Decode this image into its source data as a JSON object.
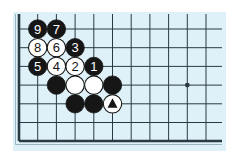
{
  "diagram": {
    "board_color": "#dff1f8",
    "line_color": "#2a3a44",
    "grid": {
      "columns": 11,
      "rows": 7,
      "left_edge": true,
      "bottom_edge": true
    },
    "star_points": [
      {
        "col": 9,
        "row": 3
      }
    ],
    "stones": [
      {
        "color": "black",
        "col": 1,
        "row": 0,
        "label": "9"
      },
      {
        "color": "black",
        "col": 2,
        "row": 0,
        "label": "7"
      },
      {
        "color": "white",
        "col": 1,
        "row": 1,
        "label": "8"
      },
      {
        "color": "white",
        "col": 2,
        "row": 1,
        "label": "6"
      },
      {
        "color": "black",
        "col": 3,
        "row": 1,
        "label": "3"
      },
      {
        "color": "black",
        "col": 1,
        "row": 2,
        "label": "5"
      },
      {
        "color": "white",
        "col": 2,
        "row": 2,
        "label": "4"
      },
      {
        "color": "white",
        "col": 3,
        "row": 2,
        "label": "2"
      },
      {
        "color": "black",
        "col": 4,
        "row": 2,
        "label": "1"
      },
      {
        "color": "black",
        "col": 2,
        "row": 3,
        "label": ""
      },
      {
        "color": "white",
        "col": 3,
        "row": 3,
        "label": ""
      },
      {
        "color": "white",
        "col": 4,
        "row": 3,
        "label": ""
      },
      {
        "color": "black",
        "col": 5,
        "row": 3,
        "label": ""
      },
      {
        "color": "black",
        "col": 3,
        "row": 4,
        "label": ""
      },
      {
        "color": "black",
        "col": 4,
        "row": 4,
        "label": ""
      },
      {
        "color": "white",
        "col": 5,
        "row": 4,
        "label": "",
        "marker": "triangle"
      }
    ]
  }
}
